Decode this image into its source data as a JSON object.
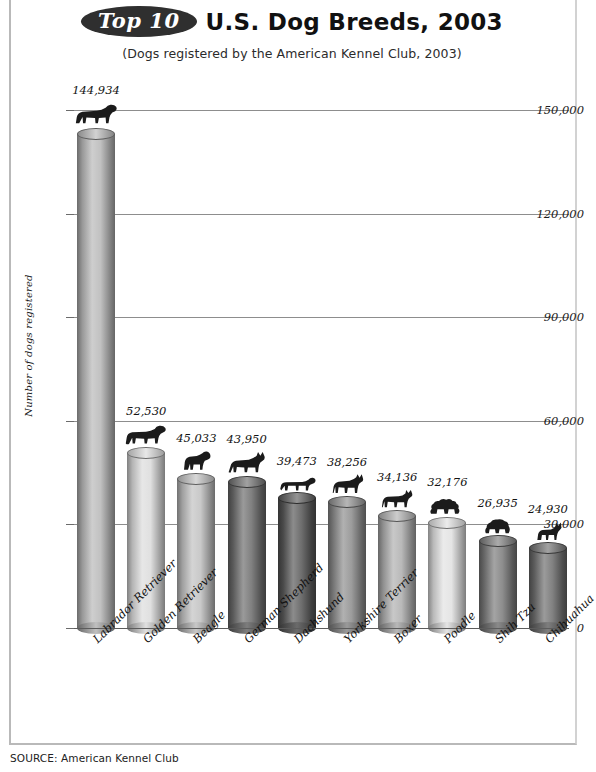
{
  "header": {
    "badge": "Top 10",
    "title": "U.S. Dog Breeds, 2003",
    "subtitle": "(Dogs registered by the American Kennel Club, 2003)"
  },
  "footer": {
    "source": "SOURCE: American Kennel Club"
  },
  "chart_data": {
    "type": "bar",
    "title": "Top 10 U.S. Dog Breeds, 2003",
    "subtitle": "(Dogs registered by the American Kennel Club, 2003)",
    "xlabel": "",
    "ylabel": "Number of dogs registered",
    "ylim": [
      0,
      150000
    ],
    "yticks": [
      0,
      30000,
      60000,
      90000,
      120000,
      150000
    ],
    "ytick_labels": [
      "0",
      "30,000",
      "60,000",
      "90,000",
      "120,000",
      "150,000"
    ],
    "grid": true,
    "legend": "none",
    "source": "American Kennel Club",
    "categories": [
      "Labrador Retriever",
      "Golden Retriever",
      "Beagle",
      "German Shepherd",
      "Dachshund",
      "Yorkshire Terrier",
      "Boxer",
      "Poodle",
      "Shih Tzu",
      "Chihuahua"
    ],
    "values": [
      144934,
      52530,
      45033,
      43950,
      39473,
      38256,
      34136,
      32176,
      26935,
      24930
    ],
    "value_labels": [
      "144,934",
      "52,530",
      "45,033",
      "43,950",
      "39,473",
      "38,256",
      "34,136",
      "32,176",
      "26,935",
      "24,930"
    ],
    "icons": [
      "labrador-retriever-icon",
      "golden-retriever-icon",
      "beagle-icon",
      "german-shepherd-icon",
      "dachshund-icon",
      "yorkshire-terrier-icon",
      "boxer-icon",
      "poodle-icon",
      "shih-tzu-icon",
      "chihuahua-icon"
    ],
    "bar_colors": [
      "#b9b9b9",
      "#dcdcdc",
      "#c2c2c2",
      "#6f6f6f",
      "#5a5a5a",
      "#8f8f8f",
      "#b0b0b0",
      "#e2e2e2",
      "#7d7d7d",
      "#707070"
    ]
  }
}
